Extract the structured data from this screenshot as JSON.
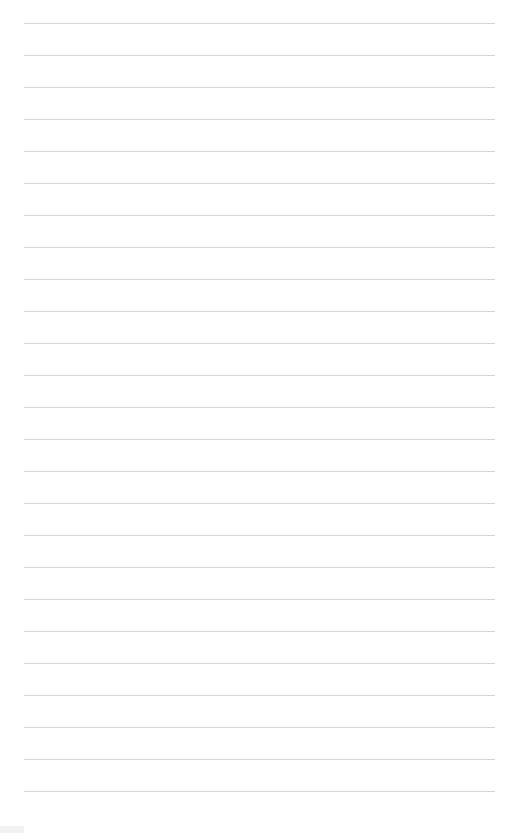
{
  "page": {
    "type": "blank lined paper",
    "line_count": 25,
    "line_spacing_px": 32,
    "line_color": "#d4d4d4",
    "background_color": "#ffffff"
  }
}
